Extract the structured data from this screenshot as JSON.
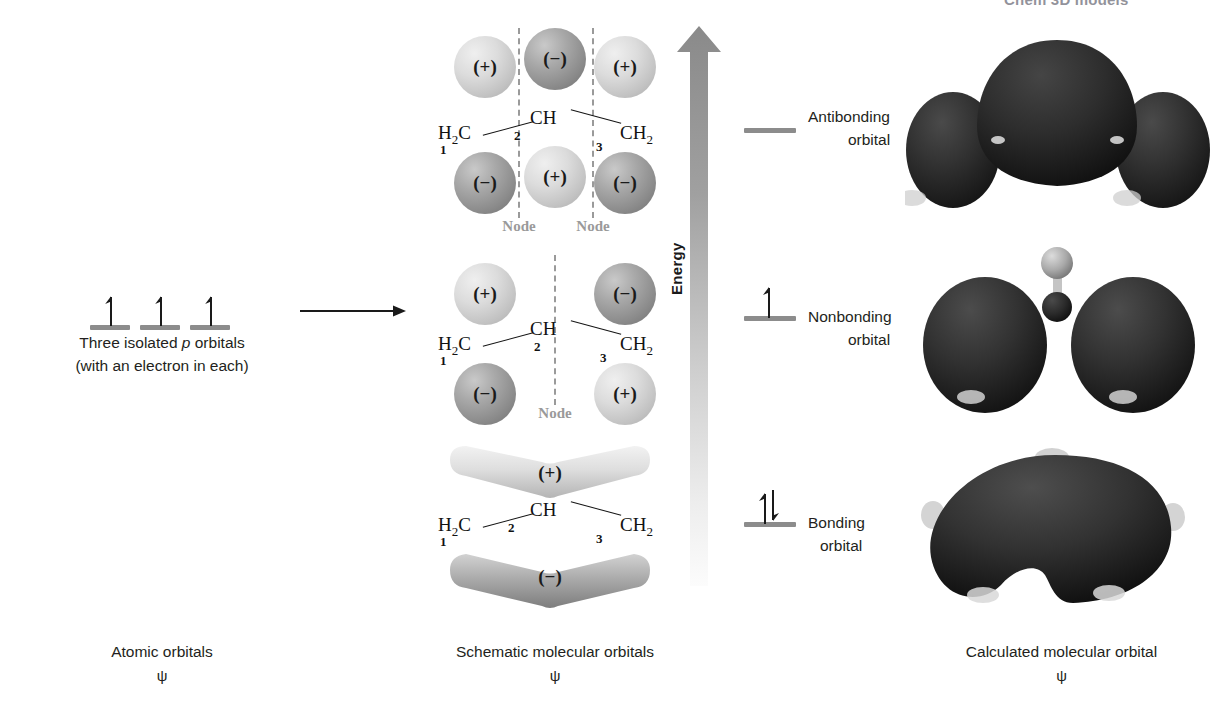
{
  "figure": {
    "top_caption": "Chem 3D models",
    "columns": [
      {
        "key": "atomic",
        "title": "Atomic orbitals",
        "psi": "ψ"
      },
      {
        "key": "schematic",
        "title": "Schematic molecular orbitals",
        "psi": "ψ"
      },
      {
        "key": "calculated",
        "title": "Calculated molecular orbital",
        "psi": "ψ"
      }
    ]
  },
  "atomic_orbitals": {
    "count": 3,
    "electrons_per_orbital": 1,
    "caption_line1_pre": "Three isolated ",
    "caption_line1_ital": "p",
    "caption_line1_post": " orbitals",
    "caption_line2": "(with an electron in each)",
    "level_color": "#8c8c8c",
    "arrow_color": "#1a1a1a"
  },
  "reaction_arrow": {
    "name": "transformation-arrow",
    "color": "#1a1a1a"
  },
  "energy_axis": {
    "label": "Energy",
    "direction": "up",
    "gradient_top": "#8e8e8e",
    "gradient_bottom": "#fbfbfb"
  },
  "molecular_orbitals": [
    {
      "id": "antibonding",
      "label_line1": "Antibonding",
      "label_line2": "orbital",
      "electrons": 0,
      "electron_spins": [],
      "nodes": 2,
      "node_label": "Node",
      "top_signs": [
        "(+)",
        "(−)",
        "(+)"
      ],
      "bottom_signs": [
        "(−)",
        "(+)",
        "(−)"
      ],
      "lobe_type": "spheres",
      "lobes_present": [
        true,
        true,
        true
      ]
    },
    {
      "id": "nonbonding",
      "label_line1": "Nonbonding",
      "label_line2": "orbital",
      "electrons": 1,
      "electron_spins": [
        "up"
      ],
      "nodes": 1,
      "node_label": "Node",
      "top_signs": [
        "(+)",
        "",
        "(−)"
      ],
      "bottom_signs": [
        "(−)",
        "",
        "(+)"
      ],
      "lobe_type": "spheres",
      "lobes_present": [
        true,
        false,
        true
      ]
    },
    {
      "id": "bonding",
      "label_line1": "Bonding",
      "label_line2": "orbital",
      "electrons": 2,
      "electron_spins": [
        "up",
        "down"
      ],
      "nodes": 0,
      "node_label": "",
      "top_signs": [
        "(+)"
      ],
      "bottom_signs": [
        "(−)"
      ],
      "lobe_type": "continuous-bent",
      "lobes_present": [
        true
      ]
    }
  ],
  "skeleton": {
    "left_group": "H",
    "left_group_sub": "2",
    "left_group_tail": "C",
    "center_group": "CH",
    "right_group": "CH",
    "right_group_sub": "2",
    "carbon_numbers": [
      "1",
      "2",
      "3"
    ]
  },
  "calculated_orbitals": [
    {
      "id": "antibonding-calc",
      "lobes": 3,
      "surface_color": "#2b2b2b",
      "shows_atoms": false
    },
    {
      "id": "nonbonding-calc",
      "lobes": 2,
      "surface_color": "#2f2f2f",
      "shows_atoms": true
    },
    {
      "id": "bonding-calc",
      "lobes": 1,
      "surface_color": "#2a2a2a",
      "shows_atoms": true
    }
  ],
  "colors": {
    "plus_lobe": "#d8d8d8",
    "minus_lobe": "#8f8f8f",
    "node_gray": "#9a9a9a",
    "level_gray": "#8c8c8c",
    "ink": "#231f20"
  }
}
